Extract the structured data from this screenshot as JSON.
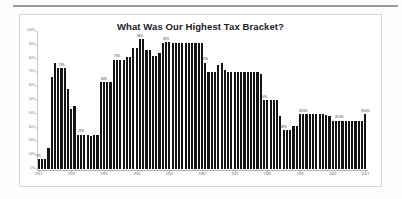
{
  "card": {
    "title": "What Was Our Highest Tax Bracket?"
  },
  "chart_data": {
    "type": "bar",
    "title": "What Was Our Highest Tax Bracket?",
    "xlabel": "",
    "ylabel": "",
    "ylim": [
      0,
      100
    ],
    "grid": false,
    "legend": false,
    "bar_color": "#151515",
    "y_ticks": [
      "0%",
      "10%",
      "20%",
      "30%",
      "40%",
      "50%",
      "60%",
      "70%",
      "80%",
      "90%",
      "100%"
    ],
    "y_tick_values": [
      0,
      10,
      20,
      30,
      40,
      50,
      60,
      70,
      80,
      90,
      100
    ],
    "x_tick_labels": [
      "1913",
      "1923",
      "1933",
      "1943",
      "1953",
      "1963",
      "1973",
      "1983",
      "1993",
      "2003",
      "2013"
    ],
    "categories": [
      "1913",
      "1914",
      "1915",
      "1916",
      "1917",
      "1918",
      "1919",
      "1920",
      "1921",
      "1922",
      "1923",
      "1924",
      "1925",
      "1926",
      "1927",
      "1928",
      "1929",
      "1930",
      "1931",
      "1932",
      "1933",
      "1934",
      "1935",
      "1936",
      "1937",
      "1938",
      "1939",
      "1940",
      "1941",
      "1942",
      "1943",
      "1944",
      "1945",
      "1946",
      "1947",
      "1948",
      "1949",
      "1950",
      "1951",
      "1952",
      "1953",
      "1954",
      "1955",
      "1956",
      "1957",
      "1958",
      "1959",
      "1960",
      "1961",
      "1962",
      "1963",
      "1964",
      "1965",
      "1966",
      "1967",
      "1968",
      "1969",
      "1970",
      "1971",
      "1972",
      "1973",
      "1974",
      "1975",
      "1976",
      "1977",
      "1978",
      "1979",
      "1980",
      "1981",
      "1982",
      "1983",
      "1984",
      "1985",
      "1986",
      "1987",
      "1988",
      "1989",
      "1990",
      "1991",
      "1992",
      "1993",
      "1994",
      "1995",
      "1996",
      "1997",
      "1998",
      "1999",
      "2000",
      "2001",
      "2002",
      "2003",
      "2004",
      "2005",
      "2006",
      "2007",
      "2008",
      "2009",
      "2010",
      "2011",
      "2012",
      "2013"
    ],
    "values": [
      7,
      7,
      7,
      15,
      67,
      77,
      73,
      73,
      73,
      58,
      43.5,
      46,
      25,
      25,
      25,
      25,
      24,
      25,
      25,
      63,
      63,
      63,
      63,
      79,
      79,
      79,
      79,
      81.1,
      81,
      88,
      88,
      94,
      94,
      86.45,
      86.45,
      82.13,
      82.13,
      84.36,
      91,
      92,
      92,
      91,
      91,
      91,
      91,
      91,
      91,
      91,
      91,
      91,
      91,
      77,
      70,
      70,
      70,
      75.25,
      77,
      71.75,
      70,
      70,
      70,
      70,
      70,
      70,
      70,
      70,
      70,
      70,
      69.125,
      50,
      50,
      50,
      50,
      50,
      38.5,
      28,
      28,
      28,
      31,
      31,
      39.6,
      39.6,
      39.6,
      39.6,
      39.6,
      39.6,
      39.6,
      39.6,
      39.1,
      38.6,
      35,
      35,
      35,
      35,
      35,
      35,
      35,
      35,
      35,
      35,
      39.6
    ],
    "annotated_bars": [
      {
        "category": "1913",
        "label": "7%"
      },
      {
        "category": "1920",
        "label": "73%"
      },
      {
        "category": "1926",
        "label": "25%"
      },
      {
        "category": "1933",
        "label": "63%"
      },
      {
        "category": "1937",
        "label": "79%"
      },
      {
        "category": "1944",
        "label": "94%"
      },
      {
        "category": "1952",
        "label": "92%"
      },
      {
        "category": "1964",
        "label": "70%"
      },
      {
        "category": "1982",
        "label": "50%"
      },
      {
        "category": "1988",
        "label": "28%"
      },
      {
        "category": "1994",
        "label": "39.6%"
      },
      {
        "category": "2005",
        "label": "35.0%"
      },
      {
        "category": "2013",
        "label": "39.6%"
      }
    ]
  }
}
